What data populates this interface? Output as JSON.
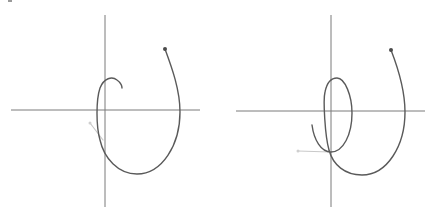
{
  "figure": {
    "panels": [
      {
        "id": "left",
        "description": "Spiral trajectory with crosshair axes, open hook ending",
        "axes": {
          "vertical": {
            "x": 105,
            "y1": 15,
            "y2": 207
          },
          "horizontal": {
            "y": 110,
            "x1": 11,
            "x2": 200
          }
        },
        "start_dot": {
          "x": 165,
          "y": 49
        },
        "curve_path": "M165,49 C172,68 180,90 180,112 C180,145 162,174 137,174 C118,174 104,158 100,140 C96,126 96,100 100,88 C104,78 112,76 117,80 C121,83 122,86 122,88",
        "tail": {
          "x1": 103,
          "y1": 140,
          "x2": 90,
          "y2": 123
        },
        "tail_dot": {
          "x": 90,
          "y": 123
        }
      },
      {
        "id": "right",
        "description": "Spiral trajectory with crosshair axes, closed inner loop",
        "axes": {
          "vertical": {
            "x": 114,
            "y1": 15,
            "y2": 207
          },
          "horizontal": {
            "y": 111,
            "x1": 19,
            "x2": 208
          }
        },
        "start_dot": {
          "x": 174,
          "y": 50
        },
        "curve_path": "M174,50 C181,68 188,92 188,112 C188,146 170,175 145,175 C128,175 116,165 112,150 C108,136 106,100 108,92 C110,82 114,78 120,78 C128,78 135,96 135,113 C135,135 126,152 114,152 C104,152 97,140 95,125",
        "tail": {
          "x1": 113,
          "y1": 152,
          "x2": 81,
          "y2": 151
        },
        "tail_dot": {
          "x": 81,
          "y": 151
        }
      }
    ],
    "colors": {
      "axis": "#7a7a7a",
      "curve": "#5a5a5a",
      "tail": "#c9c9c9",
      "start_dot": "#4a4a4a"
    }
  }
}
